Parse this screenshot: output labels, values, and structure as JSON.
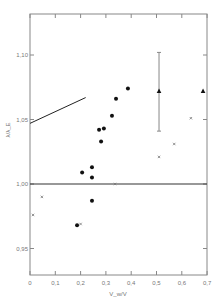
{
  "chart_data": {
    "type": "scatter",
    "title": "",
    "xlabel": "V_w/V",
    "ylabel": "λ/λ_E",
    "xlim": [
      0,
      0.7
    ],
    "ylim": [
      0.93,
      1.13
    ],
    "grid": false,
    "x_ticks": [
      "0",
      "0,1",
      "0,2",
      "0,3",
      "0,4",
      "0,5",
      "0,6",
      "0,7"
    ],
    "y_ticks": [
      "0,95",
      "1,00",
      "1,05",
      "1,10"
    ],
    "reference_line": {
      "y": 1.0
    },
    "series": [
      {
        "name": "filled circles",
        "marker": "circle",
        "points": [
          [
            0.186,
            0.968
          ],
          [
            0.206,
            1.009
          ],
          [
            0.245,
            1.013
          ],
          [
            0.245,
            1.005
          ],
          [
            0.245,
            0.987
          ],
          [
            0.273,
            1.042
          ],
          [
            0.281,
            1.033
          ],
          [
            0.292,
            1.043
          ],
          [
            0.324,
            1.053
          ],
          [
            0.34,
            1.066
          ],
          [
            0.387,
            1.074
          ]
        ]
      },
      {
        "name": "triangles",
        "marker": "triangle",
        "points": [
          [
            0.51,
            1.072
          ],
          [
            0.684,
            1.072
          ]
        ],
        "error_bar": {
          "x": 0.51,
          "low": 1.041,
          "high": 1.102
        }
      },
      {
        "name": "crosses",
        "marker": "x",
        "points": [
          [
            0.012,
            0.976
          ],
          [
            0.047,
            0.99
          ],
          [
            0.2,
            0.969
          ],
          [
            0.336,
            1.0
          ],
          [
            0.51,
            1.021
          ],
          [
            0.57,
            1.031
          ],
          [
            0.636,
            1.051
          ]
        ]
      },
      {
        "name": "line segment",
        "marker": "line",
        "points": [
          [
            0.0,
            1.047
          ],
          [
            0.22,
            1.067
          ]
        ]
      }
    ]
  }
}
